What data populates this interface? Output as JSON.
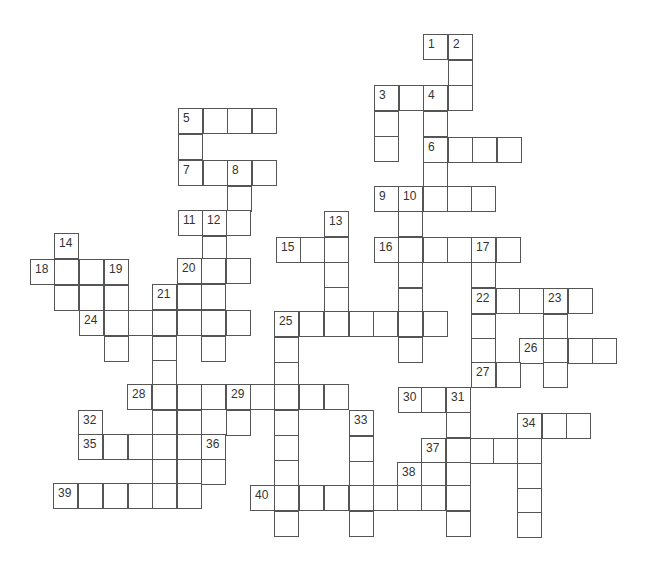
{
  "puzzle": {
    "type": "crossword",
    "cell_size": 24.5,
    "colors": {
      "line": "#555555",
      "number": "#333333",
      "background": "#ffffff"
    },
    "cells": [
      {
        "x": 423,
        "y": 34,
        "n": "1"
      },
      {
        "x": 448,
        "y": 34,
        "n": "2"
      },
      {
        "x": 448,
        "y": 60,
        "n": ""
      },
      {
        "x": 374,
        "y": 85,
        "n": "3"
      },
      {
        "x": 399,
        "y": 85,
        "n": ""
      },
      {
        "x": 423,
        "y": 85,
        "n": "4"
      },
      {
        "x": 448,
        "y": 85,
        "n": ""
      },
      {
        "x": 374,
        "y": 111,
        "n": ""
      },
      {
        "x": 423,
        "y": 111,
        "n": ""
      },
      {
        "x": 374,
        "y": 136,
        "n": ""
      },
      {
        "x": 178,
        "y": 108,
        "n": "5"
      },
      {
        "x": 203,
        "y": 108,
        "n": ""
      },
      {
        "x": 227,
        "y": 108,
        "n": ""
      },
      {
        "x": 252,
        "y": 108,
        "n": ""
      },
      {
        "x": 178,
        "y": 134,
        "n": ""
      },
      {
        "x": 423,
        "y": 137,
        "n": "6"
      },
      {
        "x": 448,
        "y": 137,
        "n": ""
      },
      {
        "x": 472,
        "y": 137,
        "n": ""
      },
      {
        "x": 497,
        "y": 137,
        "n": ""
      },
      {
        "x": 423,
        "y": 162,
        "n": ""
      },
      {
        "x": 178,
        "y": 160,
        "n": "7"
      },
      {
        "x": 203,
        "y": 160,
        "n": ""
      },
      {
        "x": 227,
        "y": 160,
        "n": "8"
      },
      {
        "x": 252,
        "y": 160,
        "n": ""
      },
      {
        "x": 227,
        "y": 186,
        "n": ""
      },
      {
        "x": 374,
        "y": 186,
        "n": "9"
      },
      {
        "x": 398,
        "y": 186,
        "n": "10"
      },
      {
        "x": 423,
        "y": 186,
        "n": ""
      },
      {
        "x": 447,
        "y": 186,
        "n": ""
      },
      {
        "x": 471,
        "y": 186,
        "n": ""
      },
      {
        "x": 398,
        "y": 211,
        "n": ""
      },
      {
        "x": 178,
        "y": 210,
        "n": "11"
      },
      {
        "x": 202,
        "y": 210,
        "n": "12"
      },
      {
        "x": 226,
        "y": 210,
        "n": ""
      },
      {
        "x": 324,
        "y": 211,
        "n": "13"
      },
      {
        "x": 202,
        "y": 236,
        "n": ""
      },
      {
        "x": 54,
        "y": 233,
        "n": "14"
      },
      {
        "x": 276,
        "y": 237,
        "n": "15"
      },
      {
        "x": 300,
        "y": 237,
        "n": ""
      },
      {
        "x": 324,
        "y": 237,
        "n": ""
      },
      {
        "x": 374,
        "y": 237,
        "n": "16"
      },
      {
        "x": 398,
        "y": 237,
        "n": ""
      },
      {
        "x": 423,
        "y": 237,
        "n": ""
      },
      {
        "x": 447,
        "y": 237,
        "n": ""
      },
      {
        "x": 471,
        "y": 237,
        "n": "17"
      },
      {
        "x": 496,
        "y": 237,
        "n": ""
      },
      {
        "x": 30,
        "y": 259,
        "n": "18"
      },
      {
        "x": 54,
        "y": 259,
        "n": ""
      },
      {
        "x": 79,
        "y": 259,
        "n": ""
      },
      {
        "x": 104,
        "y": 259,
        "n": "19"
      },
      {
        "x": 177,
        "y": 258,
        "n": "20"
      },
      {
        "x": 201,
        "y": 258,
        "n": ""
      },
      {
        "x": 226,
        "y": 258,
        "n": ""
      },
      {
        "x": 324,
        "y": 262,
        "n": ""
      },
      {
        "x": 398,
        "y": 262,
        "n": ""
      },
      {
        "x": 471,
        "y": 262,
        "n": ""
      },
      {
        "x": 54,
        "y": 285,
        "n": ""
      },
      {
        "x": 79,
        "y": 285,
        "n": ""
      },
      {
        "x": 104,
        "y": 285,
        "n": ""
      },
      {
        "x": 152,
        "y": 284,
        "n": "21"
      },
      {
        "x": 177,
        "y": 284,
        "n": ""
      },
      {
        "x": 201,
        "y": 284,
        "n": ""
      },
      {
        "x": 324,
        "y": 287,
        "n": ""
      },
      {
        "x": 398,
        "y": 288,
        "n": ""
      },
      {
        "x": 471,
        "y": 288,
        "n": "22"
      },
      {
        "x": 496,
        "y": 288,
        "n": ""
      },
      {
        "x": 519,
        "y": 288,
        "n": ""
      },
      {
        "x": 543,
        "y": 288,
        "n": "23"
      },
      {
        "x": 568,
        "y": 288,
        "n": ""
      },
      {
        "x": 79,
        "y": 310,
        "n": "24"
      },
      {
        "x": 104,
        "y": 310,
        "n": ""
      },
      {
        "x": 128,
        "y": 310,
        "n": ""
      },
      {
        "x": 152,
        "y": 310,
        "n": ""
      },
      {
        "x": 177,
        "y": 310,
        "n": ""
      },
      {
        "x": 201,
        "y": 310,
        "n": ""
      },
      {
        "x": 226,
        "y": 310,
        "n": ""
      },
      {
        "x": 274,
        "y": 311,
        "n": "25"
      },
      {
        "x": 299,
        "y": 311,
        "n": ""
      },
      {
        "x": 324,
        "y": 311,
        "n": ""
      },
      {
        "x": 349,
        "y": 311,
        "n": ""
      },
      {
        "x": 373,
        "y": 311,
        "n": ""
      },
      {
        "x": 398,
        "y": 311,
        "n": ""
      },
      {
        "x": 423,
        "y": 311,
        "n": ""
      },
      {
        "x": 471,
        "y": 314,
        "n": ""
      },
      {
        "x": 543,
        "y": 314,
        "n": ""
      },
      {
        "x": 104,
        "y": 336,
        "n": ""
      },
      {
        "x": 152,
        "y": 336,
        "n": ""
      },
      {
        "x": 201,
        "y": 336,
        "n": ""
      },
      {
        "x": 274,
        "y": 337,
        "n": ""
      },
      {
        "x": 398,
        "y": 337,
        "n": ""
      },
      {
        "x": 471,
        "y": 338,
        "n": ""
      },
      {
        "x": 519,
        "y": 338,
        "n": "26"
      },
      {
        "x": 543,
        "y": 338,
        "n": ""
      },
      {
        "x": 568,
        "y": 338,
        "n": ""
      },
      {
        "x": 592,
        "y": 338,
        "n": ""
      },
      {
        "x": 152,
        "y": 360,
        "n": ""
      },
      {
        "x": 274,
        "y": 362,
        "n": ""
      },
      {
        "x": 471,
        "y": 362,
        "n": "27"
      },
      {
        "x": 496,
        "y": 362,
        "n": ""
      },
      {
        "x": 543,
        "y": 362,
        "n": ""
      },
      {
        "x": 127,
        "y": 384,
        "n": "28"
      },
      {
        "x": 152,
        "y": 384,
        "n": ""
      },
      {
        "x": 177,
        "y": 384,
        "n": ""
      },
      {
        "x": 201,
        "y": 384,
        "n": ""
      },
      {
        "x": 226,
        "y": 384,
        "n": "29"
      },
      {
        "x": 250,
        "y": 384,
        "n": ""
      },
      {
        "x": 274,
        "y": 384,
        "n": ""
      },
      {
        "x": 299,
        "y": 384,
        "n": ""
      },
      {
        "x": 324,
        "y": 384,
        "n": ""
      },
      {
        "x": 398,
        "y": 387,
        "n": "30"
      },
      {
        "x": 421,
        "y": 387,
        "n": ""
      },
      {
        "x": 446,
        "y": 387,
        "n": "31"
      },
      {
        "x": 78,
        "y": 410,
        "n": "32"
      },
      {
        "x": 152,
        "y": 410,
        "n": ""
      },
      {
        "x": 177,
        "y": 410,
        "n": ""
      },
      {
        "x": 226,
        "y": 410,
        "n": ""
      },
      {
        "x": 274,
        "y": 410,
        "n": ""
      },
      {
        "x": 349,
        "y": 410,
        "n": "33"
      },
      {
        "x": 446,
        "y": 412,
        "n": ""
      },
      {
        "x": 517,
        "y": 413,
        "n": "34"
      },
      {
        "x": 542,
        "y": 413,
        "n": ""
      },
      {
        "x": 566,
        "y": 413,
        "n": ""
      },
      {
        "x": 78,
        "y": 434,
        "n": "35"
      },
      {
        "x": 103,
        "y": 434,
        "n": ""
      },
      {
        "x": 128,
        "y": 434,
        "n": ""
      },
      {
        "x": 152,
        "y": 434,
        "n": ""
      },
      {
        "x": 177,
        "y": 434,
        "n": ""
      },
      {
        "x": 201,
        "y": 434,
        "n": "36"
      },
      {
        "x": 274,
        "y": 435,
        "n": ""
      },
      {
        "x": 349,
        "y": 436,
        "n": ""
      },
      {
        "x": 421,
        "y": 438,
        "n": "37"
      },
      {
        "x": 446,
        "y": 438,
        "n": ""
      },
      {
        "x": 470,
        "y": 438,
        "n": ""
      },
      {
        "x": 493,
        "y": 438,
        "n": ""
      },
      {
        "x": 517,
        "y": 438,
        "n": ""
      },
      {
        "x": 152,
        "y": 459,
        "n": ""
      },
      {
        "x": 177,
        "y": 459,
        "n": ""
      },
      {
        "x": 201,
        "y": 459,
        "n": ""
      },
      {
        "x": 274,
        "y": 460,
        "n": ""
      },
      {
        "x": 349,
        "y": 461,
        "n": ""
      },
      {
        "x": 397,
        "y": 462,
        "n": "38"
      },
      {
        "x": 421,
        "y": 462,
        "n": ""
      },
      {
        "x": 446,
        "y": 462,
        "n": ""
      },
      {
        "x": 517,
        "y": 463,
        "n": ""
      },
      {
        "x": 53,
        "y": 483,
        "n": "39"
      },
      {
        "x": 78,
        "y": 483,
        "n": ""
      },
      {
        "x": 103,
        "y": 483,
        "n": ""
      },
      {
        "x": 128,
        "y": 483,
        "n": ""
      },
      {
        "x": 152,
        "y": 483,
        "n": ""
      },
      {
        "x": 177,
        "y": 483,
        "n": ""
      },
      {
        "x": 250,
        "y": 485,
        "n": "40"
      },
      {
        "x": 274,
        "y": 485,
        "n": ""
      },
      {
        "x": 299,
        "y": 485,
        "n": ""
      },
      {
        "x": 324,
        "y": 485,
        "n": ""
      },
      {
        "x": 349,
        "y": 485,
        "n": ""
      },
      {
        "x": 373,
        "y": 485,
        "n": ""
      },
      {
        "x": 397,
        "y": 485,
        "n": ""
      },
      {
        "x": 421,
        "y": 485,
        "n": ""
      },
      {
        "x": 446,
        "y": 485,
        "n": ""
      },
      {
        "x": 517,
        "y": 488,
        "n": ""
      },
      {
        "x": 274,
        "y": 511,
        "n": ""
      },
      {
        "x": 349,
        "y": 511,
        "n": ""
      },
      {
        "x": 446,
        "y": 511,
        "n": ""
      },
      {
        "x": 517,
        "y": 512,
        "n": ""
      }
    ]
  }
}
